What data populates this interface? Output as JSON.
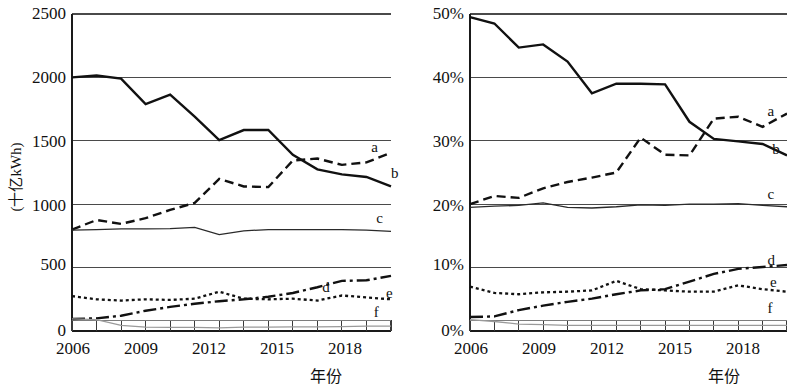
{
  "figure": {
    "title": "",
    "panels": 2
  },
  "chart_data": [
    {
      "id": "left",
      "type": "line",
      "title": "",
      "xlabel": "年份",
      "ylabel": "(十亿kWh)",
      "xlim": [
        2006,
        2019
      ],
      "ylim": [
        0,
        2500
      ],
      "ytick_labels": [
        "0",
        "500",
        "1000",
        "1500",
        "2000",
        "2500"
      ],
      "ytick_values": [
        0,
        500,
        1000,
        1500,
        2000,
        2500
      ],
      "xtick_labels": [
        "2006",
        "2009",
        "2012",
        "2015",
        "2018"
      ],
      "xtick_values": [
        2006,
        2009,
        2012,
        2015,
        2018
      ],
      "grid": "horizontal",
      "legend": "inline-right",
      "x": [
        2006,
        2007,
        2008,
        2009,
        2010,
        2011,
        2012,
        2013,
        2014,
        2015,
        2016,
        2017,
        2018,
        2019
      ],
      "series": [
        {
          "name": "b",
          "label": "b",
          "style": "solid",
          "label_x": 2019.0,
          "label_y": 1240,
          "values": [
            2000,
            2015,
            1990,
            1790,
            1865,
            1690,
            1505,
            1585,
            1585,
            1390,
            1275,
            1235,
            1215,
            1140
          ]
        },
        {
          "name": "a",
          "label": "a",
          "style": "dashed",
          "label_x": 2018.2,
          "label_y": 1440,
          "values": [
            800,
            875,
            845,
            890,
            955,
            1010,
            1200,
            1140,
            1135,
            1345,
            1360,
            1310,
            1330,
            1405
          ]
        },
        {
          "name": "c",
          "label": "c",
          "style": "thin-solid",
          "label_x": 2018.4,
          "label_y": 880,
          "values": [
            795,
            800,
            805,
            805,
            808,
            818,
            760,
            790,
            800,
            800,
            800,
            800,
            795,
            785
          ]
        },
        {
          "name": "d",
          "label": "d",
          "style": "dashdot",
          "label_x": 2016.2,
          "label_y": 340,
          "values": [
            95,
            100,
            120,
            160,
            190,
            215,
            235,
            250,
            270,
            300,
            345,
            395,
            400,
            435
          ]
        },
        {
          "name": "e",
          "label": "e",
          "style": "dotted",
          "label_x": 2018.8,
          "label_y": 295,
          "values": [
            275,
            250,
            240,
            250,
            245,
            255,
            310,
            255,
            250,
            255,
            240,
            280,
            265,
            250
          ]
        },
        {
          "name": "f",
          "label": "f",
          "style": "thin-grey",
          "label_x": 2018.3,
          "label_y": 140,
          "values": [
            95,
            90,
            45,
            30,
            28,
            28,
            25,
            30,
            30,
            32,
            32,
            35,
            38,
            38
          ]
        }
      ]
    },
    {
      "id": "right",
      "type": "line",
      "title": "",
      "xlabel": "年份",
      "ylabel": "总发电量占比",
      "xlim": [
        2006,
        2019
      ],
      "ylim": [
        0,
        50
      ],
      "ytick_labels": [
        "0%",
        "10%",
        "20%",
        "30%",
        "40%",
        "50%"
      ],
      "ytick_values": [
        0,
        10,
        20,
        30,
        40,
        50
      ],
      "xtick_labels": [
        "2006",
        "2009",
        "2012",
        "2015",
        "2018"
      ],
      "xtick_values": [
        2006,
        2009,
        2012,
        2015,
        2018
      ],
      "grid": "horizontal",
      "legend": "inline-right",
      "x": [
        2006,
        2007,
        2008,
        2009,
        2010,
        2011,
        2012,
        2013,
        2014,
        2015,
        2016,
        2017,
        2018,
        2019
      ],
      "series": [
        {
          "name": "b",
          "label": "b",
          "style": "solid",
          "label_x": 2018.4,
          "label_y": 28.6,
          "values": [
            49.5,
            48.5,
            44.7,
            45.2,
            42.5,
            37.5,
            39.0,
            39.0,
            38.9,
            33.0,
            30.3,
            29.9,
            29.5,
            27.7
          ]
        },
        {
          "name": "a",
          "label": "a",
          "style": "dashed",
          "label_x": 2018.2,
          "label_y": 34.5,
          "values": [
            20.0,
            21.3,
            21.0,
            22.5,
            23.5,
            24.2,
            25.0,
            30.5,
            27.8,
            27.7,
            33.5,
            33.8,
            32.2,
            34.3
          ]
        },
        {
          "name": "c",
          "label": "c",
          "style": "thin-solid",
          "label_x": 2018.2,
          "label_y": 21.4,
          "values": [
            19.5,
            19.7,
            19.8,
            20.2,
            19.5,
            19.4,
            19.6,
            19.9,
            19.8,
            20.0,
            20.0,
            20.1,
            19.8,
            19.6
          ]
        },
        {
          "name": "d",
          "label": "d",
          "style": "dashdot",
          "label_x": 2018.2,
          "label_y": 11.0,
          "values": [
            2.2,
            2.3,
            3.3,
            4.0,
            4.6,
            5.1,
            5.8,
            6.4,
            6.6,
            7.8,
            9.0,
            9.8,
            10.1,
            10.4
          ]
        },
        {
          "name": "e",
          "label": "e",
          "style": "dotted",
          "label_x": 2018.3,
          "label_y": 7.6,
          "values": [
            7.0,
            6.0,
            5.8,
            6.1,
            6.2,
            6.4,
            7.9,
            6.6,
            6.4,
            6.2,
            6.2,
            7.2,
            6.6,
            6.2
          ]
        },
        {
          "name": "f",
          "label": "f",
          "style": "thin-grey",
          "label_x": 2018.2,
          "label_y": 3.4,
          "values": [
            1.8,
            1.5,
            1.1,
            1.0,
            0.9,
            0.9,
            0.9,
            0.9,
            0.9,
            0.9,
            0.9,
            0.9,
            0.9,
            0.9
          ]
        }
      ]
    }
  ],
  "colors": {
    "ink": "#111111",
    "grid": "#555555",
    "axis": "#222222",
    "grey_series": "#8a8a8a"
  }
}
